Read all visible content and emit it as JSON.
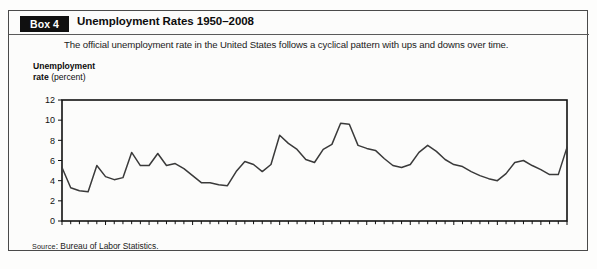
{
  "box": {
    "tab_label": "Box 4",
    "title": "Unemployment Rates 1950–2008",
    "subtitle": "The official unemployment rate in the United States follows a cyclical pattern with ups and downs over time.",
    "source_prefix": "Source",
    "source_separator": ":",
    "source_text": " Bureau of Labor Statistics."
  },
  "axis_title": {
    "line1": "Unemployment",
    "line2_strong": "rate ",
    "line2_light": "(percent)"
  },
  "colors": {
    "frame": "#4a4a4a",
    "tab_bg": "#101010",
    "tab_fg": "#ffffff",
    "plot_border": "#111111",
    "series_line": "#3a3a3a",
    "page_bg": "#fdfdfc",
    "panel_bg": "#fcfcfb"
  },
  "chart_data": {
    "type": "line",
    "title": "Unemployment Rates 1950–2008",
    "xlabel": "",
    "ylabel": "Unemployment rate (percent)",
    "xlim": [
      1950,
      2008
    ],
    "ylim": [
      0,
      12
    ],
    "yticks": [
      0,
      2,
      4,
      6,
      8,
      10,
      12
    ],
    "ytick_labels": [
      "0",
      "2",
      "4",
      "6",
      "8",
      "10",
      "12"
    ],
    "xtick_step": 1,
    "xtick_labeled": [
      {
        "x": 1950,
        "label": "1950"
      },
      {
        "x": 1955,
        "label": "55"
      },
      {
        "x": 1960,
        "label": "60"
      },
      {
        "x": 1965,
        "label": "65"
      },
      {
        "x": 1970,
        "label": "70"
      },
      {
        "x": 1975,
        "label": "75"
      },
      {
        "x": 1980,
        "label": "80"
      },
      {
        "x": 1985,
        "label": "85"
      },
      {
        "x": 1990,
        "label": "90"
      },
      {
        "x": 1995,
        "label": "95"
      },
      {
        "x": 2000,
        "label": "2000"
      },
      {
        "x": 2005,
        "label": "05"
      },
      {
        "x": 2008,
        "label": "08"
      }
    ],
    "grid": false,
    "legend": false,
    "series": [
      {
        "name": "Unemployment rate",
        "x": [
          1950,
          1951,
          1952,
          1953,
          1954,
          1955,
          1956,
          1957,
          1958,
          1959,
          1960,
          1961,
          1962,
          1963,
          1964,
          1965,
          1966,
          1967,
          1968,
          1969,
          1970,
          1971,
          1972,
          1973,
          1974,
          1975,
          1976,
          1977,
          1978,
          1979,
          1980,
          1981,
          1982,
          1983,
          1984,
          1985,
          1986,
          1987,
          1988,
          1989,
          1990,
          1991,
          1992,
          1993,
          1994,
          1995,
          1996,
          1997,
          1998,
          1999,
          2000,
          2001,
          2002,
          2003,
          2004,
          2005,
          2006,
          2007,
          2008
        ],
        "values": [
          5.3,
          3.3,
          3.0,
          2.9,
          5.5,
          4.4,
          4.1,
          4.3,
          6.8,
          5.5,
          5.5,
          6.7,
          5.5,
          5.7,
          5.2,
          4.5,
          3.8,
          3.8,
          3.6,
          3.5,
          4.9,
          5.9,
          5.6,
          4.9,
          5.6,
          8.5,
          7.7,
          7.1,
          6.1,
          5.8,
          7.1,
          7.6,
          9.7,
          9.6,
          7.5,
          7.2,
          7.0,
          6.2,
          5.5,
          5.3,
          5.6,
          6.8,
          7.5,
          6.9,
          6.1,
          5.6,
          5.4,
          4.9,
          4.5,
          4.2,
          4.0,
          4.7,
          5.8,
          6.0,
          5.5,
          5.1,
          4.6,
          4.6,
          7.3
        ]
      }
    ]
  }
}
